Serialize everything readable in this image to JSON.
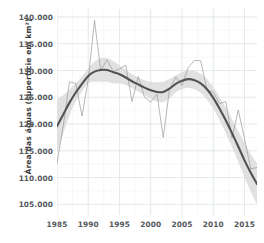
{
  "chart_data": {
    "type": "line",
    "title": "",
    "subtitle": "",
    "xlabel": "",
    "ylabel": "Área das águas (superfície em km²)",
    "xlim": [
      1985,
      2017
    ],
    "ylim": [
      103000,
      141500
    ],
    "grid": true,
    "legend": false,
    "y_tick_labels": [
      "140.000",
      "135.000",
      "130.000",
      "125.000",
      "120.000",
      "115.000",
      "110.000",
      "105.000"
    ],
    "y_tick_values": [
      140000,
      135000,
      130000,
      125000,
      120000,
      115000,
      110000,
      105000
    ],
    "x_tick_labels": [
      "1985",
      "1990",
      "1995",
      "2000",
      "2005",
      "2010",
      "2015"
    ],
    "x_tick_values": [
      1985,
      1990,
      1995,
      2000,
      2005,
      2010,
      2015
    ],
    "x": [
      1985,
      1986,
      1987,
      1988,
      1989,
      1990,
      1991,
      1992,
      1993,
      1994,
      1995,
      1996,
      1997,
      1998,
      1999,
      2000,
      2001,
      2002,
      2003,
      2004,
      2005,
      2006,
      2007,
      2008,
      2009,
      2010,
      2011,
      2012,
      2013,
      2014,
      2015,
      2016,
      2017
    ],
    "series": [
      {
        "name": "Área das águas observada",
        "role": "raw",
        "color": "#9a9a9a",
        "values": [
          112600,
          119700,
          127900,
          127600,
          121500,
          128300,
          139400,
          130000,
          132000,
          129800,
          130300,
          131000,
          124200,
          128900,
          125000,
          124100,
          125600,
          117500,
          126500,
          128800,
          127200,
          130600,
          131900,
          131800,
          126300,
          126000,
          123800,
          124200,
          117400,
          122600,
          117300,
          111600,
          111900
        ]
      },
      {
        "name": "Tendência suavizada (loess)",
        "role": "smooth",
        "color": "#4f5355",
        "values": [
          119600,
          121800,
          124000,
          125900,
          127500,
          129000,
          129800,
          130100,
          130100,
          129700,
          129300,
          128700,
          128000,
          127400,
          126800,
          126300,
          126000,
          126000,
          126600,
          127500,
          128100,
          128400,
          128200,
          127600,
          126500,
          124900,
          122900,
          120700,
          118300,
          115800,
          113200,
          110900,
          108800
        ]
      },
      {
        "name": "Intervalo de confiança (limite superior)",
        "role": "ribbon_upper",
        "color": "#d9d9d9",
        "values": [
          124600,
          125400,
          126400,
          127600,
          128900,
          130400,
          131700,
          132300,
          132300,
          131800,
          131000,
          130100,
          129300,
          128700,
          128200,
          127900,
          127800,
          127900,
          128400,
          129100,
          129700,
          130000,
          129900,
          129400,
          128400,
          126900,
          125100,
          123100,
          120900,
          118700,
          116400,
          114400,
          112700
        ]
      },
      {
        "name": "Intervalo de confiança (limite inferior)",
        "role": "ribbon_lower",
        "color": "#d9d9d9",
        "values": [
          114600,
          118200,
          121600,
          124200,
          126100,
          127600,
          127900,
          127900,
          127900,
          127600,
          127600,
          127300,
          126700,
          126100,
          125400,
          124700,
          124200,
          124100,
          124800,
          125900,
          126500,
          126800,
          126500,
          125800,
          124600,
          122900,
          120700,
          118300,
          115700,
          112900,
          110000,
          107400,
          104900
        ]
      }
    ],
    "annotations": []
  }
}
